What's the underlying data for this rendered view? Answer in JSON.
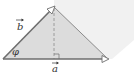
{
  "diagram": {
    "type": "vector-projection",
    "labels": {
      "vector_a": "a",
      "vector_b": "b",
      "angle": "φ"
    },
    "colors": {
      "background": "#ffffff",
      "triangle_fill": "#dcdcdc",
      "parallelogram_fill": "#f1f1f1",
      "line": "#6e6e6e",
      "dashed": "#8a8a8a",
      "text": "#333333"
    },
    "points": {
      "origin": [
        3,
        59
      ],
      "b_tip": [
        54,
        7
      ],
      "a_tip": [
        108,
        59
      ],
      "foot": [
        54,
        59
      ]
    }
  }
}
